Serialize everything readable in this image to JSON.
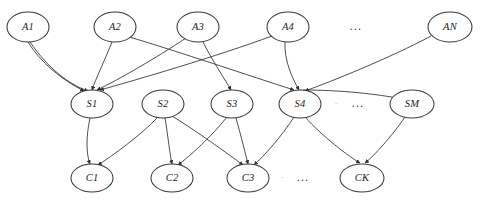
{
  "figure": {
    "kind": "layered-directed-graph",
    "background_color": "#ffffff",
    "node_fill": "#ffffff",
    "node_stroke": "#3a3a3a",
    "edge_color": "#2e2e2e",
    "label_color": "#1d1d1d"
  },
  "layers": [
    {
      "id": "layer-a",
      "name": "A",
      "y": 27,
      "nodes": [
        {
          "id": "A1",
          "label": "A1",
          "cx": 28,
          "cy": 27,
          "rx": 21,
          "ry": 15
        },
        {
          "id": "A2",
          "label": "A2",
          "cx": 115,
          "cy": 27,
          "rx": 21,
          "ry": 15
        },
        {
          "id": "A3",
          "label": "A3",
          "cx": 198,
          "cy": 27,
          "rx": 21,
          "ry": 15
        },
        {
          "id": "A4",
          "label": "A4",
          "cx": 288,
          "cy": 27,
          "rx": 21,
          "ry": 15
        },
        {
          "id": "AN",
          "label": "AN",
          "cx": 450,
          "cy": 27,
          "rx": 22,
          "ry": 15
        }
      ],
      "ellipsis": {
        "id": "ellipsis-a",
        "label": "...",
        "cx": 356,
        "cy": 27
      }
    },
    {
      "id": "layer-s",
      "name": "S",
      "y": 104,
      "nodes": [
        {
          "id": "S1",
          "label": "S1",
          "cx": 92,
          "cy": 104,
          "rx": 21,
          "ry": 14
        },
        {
          "id": "S2",
          "label": "S2",
          "cx": 163,
          "cy": 104,
          "rx": 21,
          "ry": 14
        },
        {
          "id": "S3",
          "label": "S3",
          "cx": 232,
          "cy": 104,
          "rx": 21,
          "ry": 14
        },
        {
          "id": "S4",
          "label": "S4",
          "cx": 300,
          "cy": 104,
          "rx": 21,
          "ry": 14
        },
        {
          "id": "SM",
          "label": "SM",
          "cx": 412,
          "cy": 104,
          "rx": 22,
          "ry": 14
        }
      ],
      "ellipsis": {
        "id": "ellipsis-s",
        "label": "...",
        "cx": 358,
        "cy": 104
      },
      "ellipsis_faint": {
        "id": "ellipsis-s-faint",
        "label": "·",
        "cx": 336,
        "cy": 104
      }
    },
    {
      "id": "layer-c",
      "name": "C",
      "y": 178,
      "nodes": [
        {
          "id": "C1",
          "label": "C1",
          "cx": 92,
          "cy": 178,
          "rx": 21,
          "ry": 14
        },
        {
          "id": "C2",
          "label": "C2",
          "cx": 172,
          "cy": 178,
          "rx": 21,
          "ry": 14
        },
        {
          "id": "C3",
          "label": "C3",
          "cx": 248,
          "cy": 178,
          "rx": 21,
          "ry": 14
        },
        {
          "id": "CK",
          "label": "CK",
          "cx": 362,
          "cy": 178,
          "rx": 22,
          "ry": 14
        }
      ],
      "ellipsis": {
        "id": "ellipsis-c",
        "label": "...",
        "cx": 303,
        "cy": 178
      },
      "ellipsis_faint": {
        "id": "ellipsis-c-faint",
        "label": "·",
        "cx": 282,
        "cy": 178
      }
    }
  ],
  "edges": [
    {
      "id": "e-A1-S1-a",
      "from": "A1",
      "to": "S1",
      "path": "M 28 42 C 40 62, 62 80, 84 91"
    },
    {
      "id": "e-A1-S1-b",
      "from": "A1",
      "to": "S1",
      "path": "M 30 42 C 48 68, 68 84, 88 91"
    },
    {
      "id": "e-A2-S1",
      "from": "A2",
      "to": "S1",
      "path": "M 112 42 C 104 62, 96 78, 92 90"
    },
    {
      "id": "e-A2-S4",
      "from": "A2",
      "to": "S4",
      "path": "M 126 36 C 180 52, 250 76, 294 90"
    },
    {
      "id": "e-A3-S1",
      "from": "A3",
      "to": "S1",
      "path": "M 186 38 C 156 58, 118 80, 97 90"
    },
    {
      "id": "e-A3-S3",
      "from": "A3",
      "to": "S3",
      "path": "M 203 42 C 212 60, 224 78, 231 90"
    },
    {
      "id": "e-A4-S4",
      "from": "A4",
      "to": "S4",
      "path": "M 285 42 C 284 60, 292 78, 299 90"
    },
    {
      "id": "e-A4-S1",
      "from": "A4",
      "to": "S1",
      "path": "M 272 36 C 218 56, 136 80, 100 90"
    },
    {
      "id": "e-AN-S4",
      "from": "AN",
      "to": "S4",
      "path": "M 431 36 C 390 58, 330 82, 305 91"
    },
    {
      "id": "e-S4-SM",
      "from": "S4",
      "to": "SM",
      "path": "M 303 90 C 340 90, 378 94, 402 99"
    },
    {
      "id": "e-S1-C1",
      "from": "S1",
      "to": "C1",
      "path": "M 90 118 C 86 136, 86 154, 90 164"
    },
    {
      "id": "e-S2-C1",
      "from": "S2",
      "to": "C1",
      "path": "M 158 117 C 140 136, 112 156, 98 165"
    },
    {
      "id": "e-S2-C2",
      "from": "S2",
      "to": "C2",
      "path": "M 165 118 C 168 136, 170 156, 172 164"
    },
    {
      "id": "e-S2-C3",
      "from": "S2",
      "to": "C3",
      "path": "M 172 116 C 198 132, 228 154, 243 165"
    },
    {
      "id": "e-S3-C2",
      "from": "S3",
      "to": "C2",
      "path": "M 227 117 C 212 136, 190 156, 178 165"
    },
    {
      "id": "e-S3-C3",
      "from": "S3",
      "to": "C3",
      "path": "M 236 118 C 241 136, 246 156, 248 164"
    },
    {
      "id": "e-S4-C3",
      "from": "S4",
      "to": "C3",
      "path": "M 294 117 C 282 136, 264 156, 254 165"
    },
    {
      "id": "e-S4-CK",
      "from": "S4",
      "to": "CK",
      "path": "M 305 117 C 322 136, 348 156, 360 163"
    },
    {
      "id": "e-SM-CK",
      "from": "SM",
      "to": "CK",
      "path": "M 405 117 C 392 136, 374 156, 365 163"
    }
  ]
}
